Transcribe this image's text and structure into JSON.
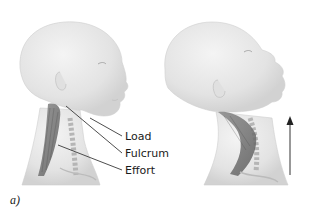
{
  "figure": {
    "panel_label": "a)",
    "left_head": {
      "pose": "neutral",
      "callouts": [
        {
          "id": "load",
          "text": "Load"
        },
        {
          "id": "fulcrum",
          "text": "Fulcrum"
        },
        {
          "id": "effort",
          "text": "Effort"
        }
      ]
    },
    "right_head": {
      "pose": "extended (looking up)",
      "arrow": "upward"
    },
    "colors": {
      "skin": "#e6e6e6",
      "skin_shadow": "#cfcfcf",
      "muscle": "#6e6e6e",
      "leader_line": "#3a3a3a",
      "arrow": "#333333"
    }
  }
}
